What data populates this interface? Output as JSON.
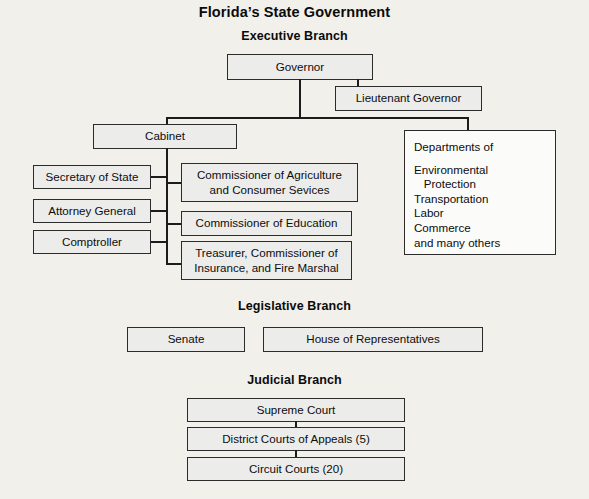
{
  "title": "Florida’s State Government",
  "sections": {
    "executive": {
      "heading": "Executive Branch"
    },
    "legislative": {
      "heading": "Legislative Branch"
    },
    "judicial": {
      "heading": "Judicial Branch"
    }
  },
  "executive": {
    "governor": "Governor",
    "lieutenant_governor": "Lieutenant Governor",
    "cabinet": "Cabinet",
    "cabinet_left": [
      "Secretary of State",
      "Attorney General",
      "Comptroller"
    ],
    "cabinet_right": [
      "Commissioner of Agriculture and Consumer Sevices",
      "Commissioner of Education",
      "Treasurer, Commissioner of Insurance, and Fire Marshal"
    ],
    "departments": {
      "header": "Departments of",
      "items": [
        "Environmental",
        "   Protection",
        "Transportation",
        "Labor",
        "Commerce",
        "and many others"
      ]
    }
  },
  "legislative": {
    "senate": "Senate",
    "house": "House of Representatives"
  },
  "judicial": {
    "supreme_court": "Supreme Court",
    "district_courts": "District Courts of Appeals (5)",
    "circuit_courts": "Circuit Courts (20)"
  },
  "colors": {
    "background": "#f1f0eb",
    "box_fill": "#ececeb",
    "box_fill_plain": "#fbfbfa",
    "line": "#1c1c1c",
    "text": "#0d0d0d"
  }
}
